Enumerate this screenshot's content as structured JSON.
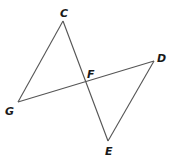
{
  "diagram": {
    "type": "geometry",
    "line_color": "#555555",
    "label_color": "#1a1a1a",
    "points": {
      "C": {
        "label": "C",
        "x": 63,
        "y": 21,
        "lx": 60,
        "ly": 17
      },
      "G": {
        "label": "G",
        "x": 18,
        "y": 102,
        "lx": 5,
        "ly": 115
      },
      "D": {
        "label": "D",
        "x": 154,
        "y": 61,
        "lx": 157,
        "ly": 62
      },
      "E": {
        "label": "E",
        "x": 108,
        "y": 141,
        "lx": 105,
        "ly": 155
      },
      "F": {
        "label": "F",
        "x": 86,
        "y": 83,
        "lx": 87,
        "ly": 78
      }
    },
    "segments": [
      {
        "from": "C",
        "to": "G"
      },
      {
        "from": "G",
        "to": "D"
      },
      {
        "from": "C",
        "to": "E"
      },
      {
        "from": "D",
        "to": "E"
      }
    ]
  }
}
